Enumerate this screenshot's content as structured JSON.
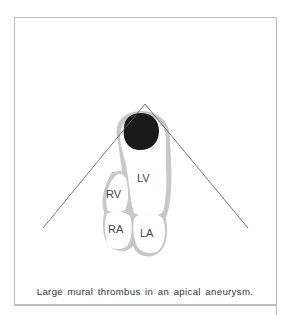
{
  "figure": {
    "caption": "Large mural thrombus in an apical aneurysm.",
    "labels": {
      "lv": "LV",
      "rv": "RV",
      "ra": "RA",
      "la": "LA"
    },
    "colors": {
      "wall": "#c8c8c8",
      "thrombus": "#1a1a1a",
      "sector_line": "#555555",
      "frame": "#bdbdbd"
    }
  }
}
